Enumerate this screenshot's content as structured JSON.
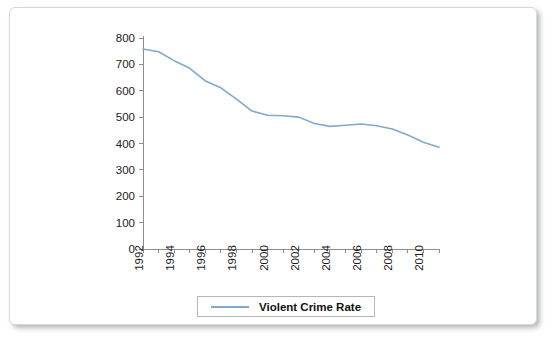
{
  "chart_data": {
    "type": "line",
    "title": "",
    "xlabel": "",
    "ylabel": "",
    "grid": false,
    "legend_position": "bottom-center",
    "accent_color": "#7FA9D0",
    "axis_color": "#8D8D8D",
    "xlim": [
      1992,
      2011
    ],
    "ylim": [
      0,
      800
    ],
    "ytick_step": 100,
    "xtick_step": 1,
    "xlabel_step": 2,
    "yticks": [
      0,
      100,
      200,
      300,
      400,
      500,
      600,
      700,
      800
    ],
    "ytick_labels": [
      "0",
      "100",
      "200",
      "300",
      "400",
      "500",
      "600",
      "700",
      "800"
    ],
    "xticks": [
      1992,
      1993,
      1994,
      1995,
      1996,
      1997,
      1998,
      1999,
      2000,
      2001,
      2002,
      2003,
      2004,
      2005,
      2006,
      2007,
      2008,
      2009,
      2010,
      2011
    ],
    "xtick_labels": [
      "1992",
      "",
      "1994",
      "",
      "1996",
      "",
      "1998",
      "",
      "2000",
      "",
      "2002",
      "",
      "2004",
      "",
      "2006",
      "",
      "2008",
      "",
      "2010",
      ""
    ],
    "categories": [
      1992,
      1993,
      1994,
      1995,
      1996,
      1997,
      1998,
      1999,
      2000,
      2001,
      2002,
      2003,
      2004,
      2005,
      2006,
      2007,
      2008,
      2009,
      2010,
      2011
    ],
    "series": [
      {
        "name": "Violent Crime Rate",
        "color": "#7FA9D0",
        "values": [
          758,
          748,
          714,
          685,
          637,
          611,
          568,
          523,
          507,
          505,
          500,
          476,
          465,
          469,
          474,
          467,
          455,
          432,
          405,
          386
        ]
      }
    ],
    "legend": [
      {
        "label": "Violent Crime Rate",
        "color": "#7FA9D0"
      }
    ]
  }
}
